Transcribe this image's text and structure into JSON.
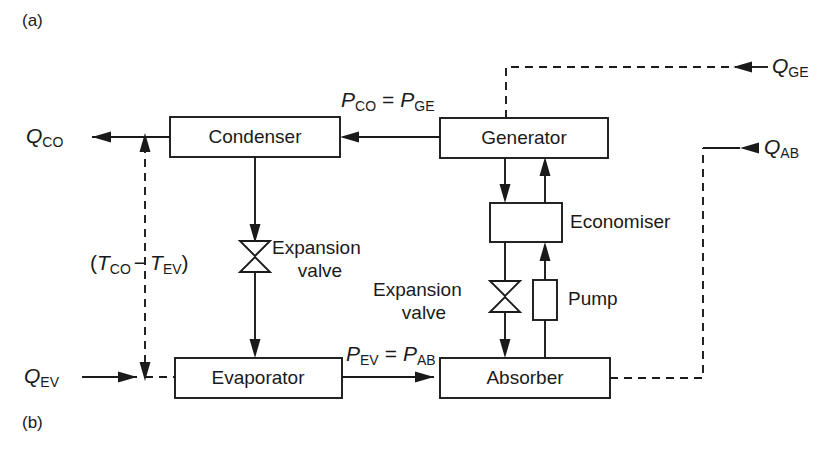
{
  "figure": {
    "panel_a_label": "(a)",
    "panel_b_label": "(b)",
    "type": "process-flow-diagram"
  },
  "blocks": [
    {
      "id": "condenser",
      "label": "Condenser"
    },
    {
      "id": "generator",
      "label": "Generator"
    },
    {
      "id": "economiser",
      "label": "Economiser"
    },
    {
      "id": "evaporator",
      "label": "Evaporator"
    },
    {
      "id": "absorber",
      "label": "Absorber"
    },
    {
      "id": "pump",
      "label": "Pump"
    }
  ],
  "components": {
    "expansion_valve_left_line1": "Expansion",
    "expansion_valve_left_line2": "valve",
    "expansion_valve_right_line1": "Expansion",
    "expansion_valve_right_line2": "valve",
    "economiser_label": "Economiser",
    "pump_label": "Pump"
  },
  "heat_flows": {
    "q_co": {
      "base": "Q",
      "sub": "CO",
      "direction": "out-left"
    },
    "q_ev": {
      "base": "Q",
      "sub": "EV",
      "direction": "in-left"
    },
    "q_ge": {
      "base": "Q",
      "sub": "GE",
      "direction": "in-right"
    },
    "q_ab": {
      "base": "Q",
      "sub": "AB",
      "direction": "out-right"
    }
  },
  "pressure_labels": {
    "top": {
      "left_base": "P",
      "left_sub": "CO",
      "eq": "=",
      "right_base": "P",
      "right_sub": "GE"
    },
    "bottom": {
      "left_base": "P",
      "left_sub": "EV",
      "eq": "=",
      "right_base": "P",
      "right_sub": "AB"
    }
  },
  "temperature_label": {
    "open": "(",
    "left_base": "T",
    "left_sub": "CO",
    "minus": "−",
    "right_base": "T",
    "right_sub": "EV",
    "close": ")"
  },
  "colors": {
    "ink": "#1a1a1a",
    "background": "#ffffff"
  }
}
